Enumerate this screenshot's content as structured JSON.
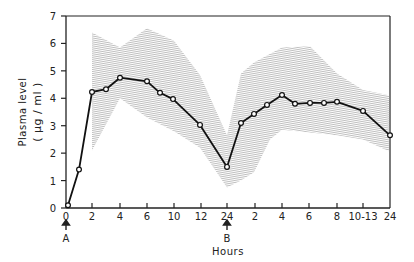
{
  "chart_data": {
    "type": "line",
    "title": "",
    "xlabel": "Hours",
    "ylabel": "Plasma level",
    "ylabel_units": "(µg/ml)",
    "ylim": [
      0,
      7
    ],
    "y_ticks": [
      "0",
      "1",
      "2",
      "3",
      "4",
      "5",
      "6",
      "7"
    ],
    "x_ticks": [
      "0",
      "2",
      "4",
      "6",
      "10",
      "12",
      "24",
      "2",
      "4",
      "6",
      "8",
      "10-13",
      "24"
    ],
    "annotations": [
      {
        "label": "A",
        "at_tick": "0",
        "arrow": "up"
      },
      {
        "label": "B",
        "at_tick": "24",
        "arrow": "up"
      }
    ],
    "grid": false,
    "legend": null,
    "series": [
      {
        "name": "Mean plasma level",
        "style": "line with open circle markers",
        "x_px": [
          68,
          79,
          92,
          106,
          120,
          147,
          160,
          173,
          200,
          227,
          241,
          254,
          267,
          282,
          295,
          310,
          324,
          337,
          363,
          390
        ],
        "values": [
          0.1,
          1.4,
          4.23,
          4.33,
          4.75,
          4.62,
          4.2,
          3.97,
          3.03,
          1.5,
          3.1,
          3.43,
          3.76,
          4.12,
          3.8,
          3.83,
          3.83,
          3.87,
          3.54,
          2.65
        ]
      },
      {
        "name": "Range band (upper)",
        "style": "hatched shaded region",
        "x_px": [
          92,
          120,
          147,
          174,
          200,
          227,
          241,
          254,
          282,
          310,
          337,
          363,
          390
        ],
        "values": [
          6.4,
          5.85,
          6.55,
          6.1,
          4.85,
          2.65,
          4.9,
          5.3,
          5.85,
          5.9,
          4.9,
          4.3,
          4.1
        ]
      },
      {
        "name": "Range band (lower)",
        "style": "hatched shaded region",
        "x_px": [
          92,
          120,
          147,
          174,
          200,
          227,
          241,
          254,
          270,
          282,
          310,
          337,
          363,
          390
        ],
        "values": [
          2.1,
          4.0,
          3.3,
          2.8,
          2.2,
          0.75,
          1.0,
          1.3,
          2.5,
          2.85,
          2.75,
          2.65,
          2.5,
          2.05
        ]
      }
    ]
  },
  "labels": {
    "ylabel": "Plasma level",
    "ylabel_units": "( µg / ml )",
    "xlabel": "Hours",
    "marker_a": "A",
    "marker_b": "B"
  },
  "colors": {
    "line": "#111111",
    "band": "#9a9a9a",
    "axis": "#222222"
  }
}
